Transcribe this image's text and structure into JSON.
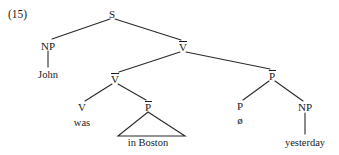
{
  "figure": {
    "example_number": "(15)",
    "type": "syntax-tree",
    "sentence": "John was in Boston ø yesterday",
    "line_color": "#2a2a2a",
    "text_color": "#1a1a1a",
    "background_color": "#ffffff"
  },
  "nodes": {
    "root": {
      "label": "S",
      "barred": false,
      "x": 112,
      "y": 14
    },
    "subject_np": {
      "label": "NP",
      "barred": false,
      "x": 48,
      "y": 46
    },
    "vbar_upper": {
      "label": "V",
      "barred": true,
      "x": 183,
      "y": 47
    },
    "vbar_lower": {
      "label": "V",
      "barred": true,
      "x": 115,
      "y": 79
    },
    "pbar_right": {
      "label": "P",
      "barred": true,
      "x": 272,
      "y": 76
    },
    "verb": {
      "label": "V",
      "barred": false,
      "x": 82,
      "y": 108
    },
    "pbar_lower": {
      "label": "P",
      "barred": true,
      "x": 148,
      "y": 107
    },
    "prep_null": {
      "label": "P",
      "barred": false,
      "x": 240,
      "y": 107
    },
    "adjunct_np": {
      "label": "NP",
      "barred": false,
      "x": 305,
      "y": 108
    }
  },
  "terminals": {
    "subject": {
      "text": "John",
      "x": 48,
      "y": 74
    },
    "verb_word": {
      "text": "was",
      "x": 82,
      "y": 122
    },
    "null_prep": {
      "text": "ø",
      "x": 240,
      "y": 120
    },
    "triangle_phrase": {
      "text": "in Boston",
      "x": 148,
      "y": 142
    },
    "adjunct_word": {
      "text": "yesterday",
      "x": 305,
      "y": 142
    }
  },
  "edges": [
    {
      "name": "s-to-np",
      "x1": 110,
      "y1": 19,
      "x2": 52,
      "y2": 39
    },
    {
      "name": "s-to-vbar-upper",
      "x1": 115,
      "y1": 19,
      "x2": 181,
      "y2": 40
    },
    {
      "name": "np-to-john",
      "x1": 48,
      "y1": 51,
      "x2": 48,
      "y2": 67
    },
    {
      "name": "vbar-upper-to-vbar-lower",
      "x1": 180,
      "y1": 52,
      "x2": 119,
      "y2": 72
    },
    {
      "name": "vbar-upper-to-pbar-right",
      "x1": 186,
      "y1": 52,
      "x2": 270,
      "y2": 69
    },
    {
      "name": "vbar-lower-to-v",
      "x1": 112,
      "y1": 84,
      "x2": 85,
      "y2": 101
    },
    {
      "name": "vbar-lower-to-pbar-lower",
      "x1": 118,
      "y1": 84,
      "x2": 146,
      "y2": 100
    },
    {
      "name": "pbar-right-to-p",
      "x1": 269,
      "y1": 81,
      "x2": 243,
      "y2": 100
    },
    {
      "name": "pbar-right-to-np",
      "x1": 275,
      "y1": 81,
      "x2": 303,
      "y2": 101
    },
    {
      "name": "np-to-yesterday",
      "x1": 305,
      "y1": 113,
      "x2": 305,
      "y2": 134
    }
  ],
  "triangle": {
    "name": "in-boston-triangle",
    "apex_x": 148,
    "apex_y": 112,
    "left_x": 118,
    "right_x": 185,
    "base_y": 136
  }
}
